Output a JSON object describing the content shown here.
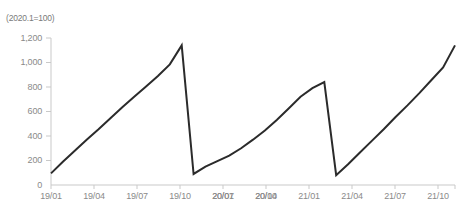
{
  "chart_data": {
    "type": "line",
    "title": "",
    "subtitle": "",
    "unit_label": "(2020.1=100)",
    "xlabel": "",
    "ylabel": "",
    "ylim": [
      0,
      1200
    ],
    "yticks": [
      0,
      200,
      400,
      600,
      800,
      1000,
      1200
    ],
    "ytick_labels": [
      "0",
      "200",
      "400",
      "600",
      "800",
      "1,000",
      "1,200"
    ],
    "xtick_labels": [
      "19/01",
      "19/04",
      "19/07",
      "19/10",
      "20/01",
      "20/04",
      "20/07",
      "20/10",
      "21/01",
      "21/04",
      "21/07",
      "21/10"
    ],
    "grid": false,
    "legend": null,
    "line_color": "#2b2b2b",
    "line_width": 2,
    "axis_color": "#c9c9c9",
    "series": [
      {
        "name": "Index (2020.1=100)",
        "x": [
          "19/01",
          "19/02",
          "19/03",
          "19/04",
          "19/05",
          "19/06",
          "19/07",
          "19/08",
          "19/09",
          "19/10",
          "19/11",
          "19/12",
          "20/01",
          "20/02",
          "20/03",
          "20/04",
          "20/05",
          "20/06",
          "20/07",
          "20/08",
          "20/09",
          "20/10",
          "20/11",
          "20/12",
          "21/01",
          "21/02",
          "21/03",
          "21/04",
          "21/05",
          "21/06",
          "21/07",
          "21/08",
          "21/09",
          "21/10",
          "21/11"
        ],
        "values": [
          95,
          190,
          280,
          370,
          455,
          545,
          635,
          720,
          805,
          890,
          985,
          1140,
          90,
          150,
          195,
          240,
          300,
          370,
          445,
          530,
          625,
          720,
          790,
          840,
          80,
          170,
          265,
          360,
          455,
          555,
          650,
          750,
          855,
          960,
          1140
        ]
      }
    ]
  }
}
